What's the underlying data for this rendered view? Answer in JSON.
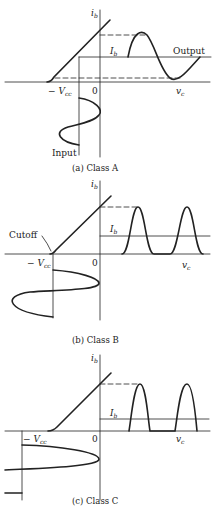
{
  "figure": {
    "panels": [
      {
        "caption": "(a) Class A",
        "y_axis_label": "i",
        "y_axis_sub": "b",
        "x_axis_label": "v",
        "x_axis_sub": "c",
        "origin_label": "0",
        "vcc_label": "− V",
        "vcc_sub": "cc",
        "bias_label": "I",
        "bias_sub": "b",
        "output_label": "Output",
        "input_label": "Input"
      },
      {
        "caption": "(b) Class B",
        "y_axis_label": "i",
        "y_axis_sub": "b",
        "x_axis_label": "v",
        "x_axis_sub": "c",
        "origin_label": "0",
        "vcc_label": "− V",
        "vcc_sub": "cc",
        "bias_label": "I",
        "bias_sub": "b",
        "cutoff_label": "Cutoff"
      },
      {
        "caption": "(c) Class C",
        "y_axis_label": "i",
        "y_axis_sub": "b",
        "x_axis_label": "v",
        "x_axis_sub": "c",
        "origin_label": "0",
        "vcc_label": "− V",
        "vcc_sub": "cc",
        "bias_label": "I",
        "bias_sub": "b"
      }
    ]
  }
}
